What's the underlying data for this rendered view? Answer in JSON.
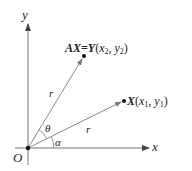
{
  "diagram": {
    "type": "vector-rotation",
    "colors": {
      "axis": "#777777",
      "vector": "#8a8a8a",
      "text": "#222222",
      "point": "#111111",
      "arrow": "#444444"
    },
    "axes": {
      "x_label": "x",
      "y_label": "y",
      "origin_label": "O"
    },
    "points": {
      "x_point": {
        "name": "X",
        "open": "(",
        "c1": "x",
        "c1_sub": "1",
        "sep": ",",
        "c2": "y",
        "c2_sub": "1",
        "close": ")"
      },
      "y_point": {
        "prefix": "AX=Y",
        "open": "(",
        "c1": "x",
        "c1_sub": "2",
        "sep": ",",
        "c2": "y",
        "c2_sub": "2",
        "close": ")"
      }
    },
    "vector_labels": {
      "upper_r": "r",
      "lower_r": "r"
    },
    "angles": {
      "theta": "θ",
      "alpha": "α"
    }
  }
}
